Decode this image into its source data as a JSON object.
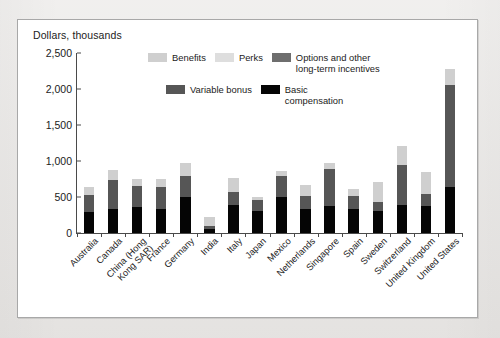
{
  "figure": {
    "axis_title": "Dollars, thousands"
  },
  "legend": {
    "items": [
      {
        "label": "Benefits",
        "color": "#cfcfcf",
        "key": "benefits"
      },
      {
        "label": "Perks",
        "color": "#dedede",
        "key": "perks"
      },
      {
        "label": "Options and other\nlong-term incentives",
        "color": "#6e6e6e",
        "key": "options"
      },
      {
        "label": "Variable bonus",
        "color": "#565656",
        "key": "variable"
      },
      {
        "label": "Basic\ncompensation",
        "color": "#050505",
        "key": "basic"
      }
    ]
  },
  "chart_data": {
    "type": "bar",
    "subtype": "stacked",
    "title": "",
    "xlabel": "",
    "ylabel": "Dollars, thousands",
    "ylim": [
      0,
      2500
    ],
    "yticks": [
      0,
      500,
      1000,
      1500,
      2000,
      2500
    ],
    "ytick_labels": [
      "0",
      "500",
      "1,000",
      "1,500",
      "2,000",
      "2,500"
    ],
    "grid": false,
    "legend_position": "inside-top",
    "categories": [
      "Australia",
      "Canada",
      "China (Hong\nKong SAR)",
      "France",
      "Germany",
      "India",
      "Italy",
      "Japan",
      "Mexico",
      "Netherlands",
      "Singapore",
      "Spain",
      "Sweden",
      "Switzerland",
      "United Kingdom",
      "United States"
    ],
    "series": [
      {
        "name": "Basic compensation",
        "color": "#050505",
        "values": [
          290,
          340,
          355,
          330,
          500,
          55,
          390,
          300,
          500,
          340,
          370,
          340,
          310,
          390,
          375,
          640
        ]
      },
      {
        "name": "Variable bonus",
        "color": "#565656",
        "values": [
          240,
          400,
          295,
          310,
          295,
          45,
          180,
          160,
          285,
          175,
          520,
          180,
          115,
          560,
          165,
          1420
        ]
      },
      {
        "name": "Options and other long-term incentives",
        "color": "#6e6e6e",
        "values": [
          0,
          0,
          0,
          0,
          0,
          0,
          0,
          0,
          0,
          0,
          0,
          0,
          0,
          0,
          0,
          0
        ]
      },
      {
        "name": "Perks",
        "color": "#dedede",
        "values": [
          0,
          0,
          0,
          0,
          0,
          0,
          0,
          0,
          0,
          0,
          0,
          0,
          0,
          0,
          0,
          0
        ]
      },
      {
        "name": "Benefits",
        "color": "#cfcfcf",
        "values": [
          115,
          140,
          105,
          105,
          175,
          125,
          200,
          35,
          70,
          155,
          80,
          85,
          290,
          255,
          310,
          220
        ]
      }
    ],
    "totals": [
      645,
      880,
      755,
      745,
      970,
      225,
      770,
      495,
      855,
      670,
      970,
      605,
      715,
      1205,
      850,
      2280
    ]
  }
}
